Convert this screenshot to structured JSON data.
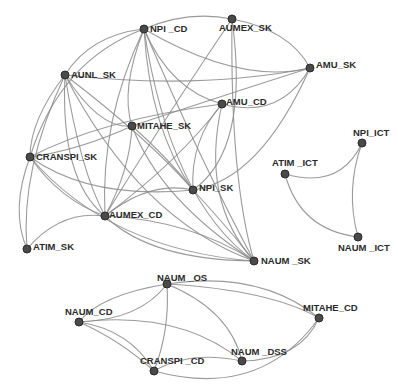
{
  "diagram": {
    "type": "network-graph",
    "colors": {
      "edge": "#8a8a8a",
      "node": "#4a4a4a",
      "label": "#2b2b2b",
      "background": "#ffffff"
    },
    "nodes": [
      {
        "id": "NPI_CD",
        "label": "NPI _CD",
        "x": 144,
        "y": 29,
        "lx": 6,
        "ly": 3
      },
      {
        "id": "AUMEX_SK",
        "label": "AUMEX_SK",
        "x": 232,
        "y": 19,
        "lx": -13,
        "ly": 12
      },
      {
        "id": "AMU_SK",
        "label": "AMU_SK",
        "x": 310,
        "y": 68,
        "lx": 6,
        "ly": 0
      },
      {
        "id": "AUNL_SK",
        "label": "AUNL_SK",
        "x": 65,
        "y": 75,
        "lx": 6,
        "ly": 3
      },
      {
        "id": "AMU_CD",
        "label": "AMU_CD",
        "x": 222,
        "y": 104,
        "lx": 4,
        "ly": 1
      },
      {
        "id": "MITAHE_SK",
        "label": "MITAHE_SK",
        "x": 132,
        "y": 126,
        "lx": 5,
        "ly": 3
      },
      {
        "id": "CRANSPI_SK",
        "label": "CRANSPI_SK",
        "x": 30,
        "y": 157,
        "lx": 6,
        "ly": 3
      },
      {
        "id": "NPI_SK",
        "label": "NPI_SK",
        "x": 193,
        "y": 190,
        "lx": 6,
        "ly": 1
      },
      {
        "id": "AUMEX_CD",
        "label": "AUMEX_CD",
        "x": 105,
        "y": 216,
        "lx": 4,
        "ly": 2
      },
      {
        "id": "ATIM_SK",
        "label": "ATIM_SK",
        "x": 27,
        "y": 249,
        "lx": 6,
        "ly": 1
      },
      {
        "id": "NAUM_SK",
        "label": "NAUM _SK",
        "x": 254,
        "y": 261,
        "lx": 7,
        "ly": 3
      },
      {
        "id": "NPI_ICT",
        "label": "NPI_ICT",
        "x": 362,
        "y": 143,
        "lx": -9,
        "ly": -7
      },
      {
        "id": "ATIM_ICT",
        "label": "ATIM _ICT",
        "x": 285,
        "y": 174,
        "lx": -13,
        "ly": -8
      },
      {
        "id": "NAUM_ICT",
        "label": "NAUM _ICT",
        "x": 358,
        "y": 237,
        "lx": -20,
        "ly": 14
      },
      {
        "id": "NAUM_OS",
        "label": "NAUM _OS",
        "x": 167,
        "y": 284,
        "lx": -10,
        "ly": -3
      },
      {
        "id": "NAUM_CD",
        "label": "NAUM_CD",
        "x": 79,
        "y": 322,
        "lx": -14,
        "ly": -7
      },
      {
        "id": "MITAHE_CD",
        "label": "MITAHE_CD",
        "x": 319,
        "y": 318,
        "lx": -16,
        "ly": -7
      },
      {
        "id": "NAUM_DSS",
        "label": "NAUM _DSS",
        "x": 242,
        "y": 361,
        "lx": -11,
        "ly": -6
      },
      {
        "id": "CRANSPI_CD",
        "label": "CRANSPI _CD",
        "x": 154,
        "y": 371,
        "lx": -14,
        "ly": -7
      }
    ],
    "edges": [
      {
        "d": "M144,29 Q188,10 232,19"
      },
      {
        "d": "M144,29 Q240,85 310,68"
      },
      {
        "d": "M144,29 Q170,90 222,104"
      },
      {
        "d": "M144,29 Q90,35 65,75"
      },
      {
        "d": "M144,29 Q60,60 30,157"
      },
      {
        "d": "M144,29 Q120,90 132,126"
      },
      {
        "d": "M144,29 Q150,130 193,190"
      },
      {
        "d": "M144,29 Q100,120 105,216"
      },
      {
        "d": "M144,29 Q170,200 254,261"
      },
      {
        "d": "M144,29 Q200,160 254,261"
      },
      {
        "d": "M232,19 Q290,30 310,68"
      },
      {
        "d": "M232,19 Q170,110 105,216"
      },
      {
        "d": "M232,19 Q250,150 193,190"
      },
      {
        "d": "M232,19 Q230,180 254,261"
      },
      {
        "d": "M310,68 Q240,90 132,126"
      },
      {
        "d": "M310,68 Q260,180 193,190"
      },
      {
        "d": "M310,68 Q200,90 65,75"
      },
      {
        "d": "M310,68 Q280,120 222,104"
      },
      {
        "d": "M65,75 Q150,140 193,190"
      },
      {
        "d": "M65,75 Q80,170 105,216"
      },
      {
        "d": "M65,75 Q30,120 30,157"
      },
      {
        "d": "M65,75 Q100,130 132,126"
      },
      {
        "d": "M65,75 Q20,170 27,249"
      },
      {
        "d": "M65,75 Q140,220 254,261"
      },
      {
        "d": "M65,75 Q60,180 105,216"
      },
      {
        "d": "M222,104 Q180,160 105,216"
      },
      {
        "d": "M222,104 Q200,200 254,261"
      },
      {
        "d": "M222,104 Q190,140 193,190"
      },
      {
        "d": "M222,104 Q100,120 30,157"
      },
      {
        "d": "M132,126 Q80,150 30,157"
      },
      {
        "d": "M132,126 Q130,170 105,216"
      },
      {
        "d": "M132,126 Q160,200 254,261"
      },
      {
        "d": "M132,126 Q170,160 193,190"
      },
      {
        "d": "M30,157 Q90,200 193,190"
      },
      {
        "d": "M30,157 Q60,200 105,216"
      },
      {
        "d": "M30,157 Q110,250 254,261"
      },
      {
        "d": "M30,157 Q10,210 27,249"
      },
      {
        "d": "M27,249 Q60,210 105,216"
      },
      {
        "d": "M105,216 Q150,180 193,190"
      },
      {
        "d": "M105,216 Q190,220 254,261"
      },
      {
        "d": "M105,216 Q150,260 254,261"
      },
      {
        "d": "M193,190 Q230,230 254,261"
      },
      {
        "d": "M285,174 Q340,190 362,143"
      },
      {
        "d": "M285,174 Q300,230 358,237"
      },
      {
        "d": "M362,143 Q345,190 358,237"
      },
      {
        "d": "M167,284 Q100,295 79,322"
      },
      {
        "d": "M167,284 Q140,320 79,322"
      },
      {
        "d": "M167,284 Q170,330 154,371"
      },
      {
        "d": "M167,284 Q230,310 242,361"
      },
      {
        "d": "M167,284 Q260,270 319,318"
      },
      {
        "d": "M167,284 Q270,290 319,318"
      },
      {
        "d": "M79,322 Q130,330 154,371"
      },
      {
        "d": "M79,322 Q180,310 242,361"
      },
      {
        "d": "M79,322 Q120,340 154,371"
      },
      {
        "d": "M154,371 Q190,350 242,361"
      },
      {
        "d": "M154,371 Q260,400 319,318"
      },
      {
        "d": "M242,361 Q300,360 319,318"
      }
    ]
  }
}
